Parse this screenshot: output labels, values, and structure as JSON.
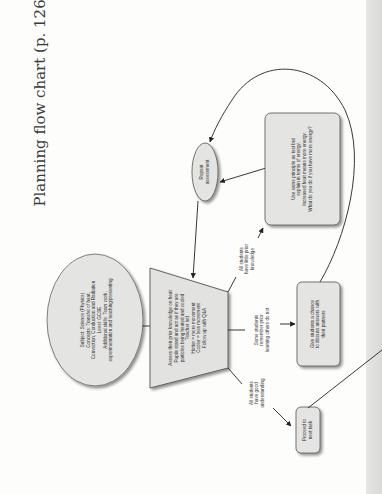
{
  "title": "Planning flow chart (p. 126)",
  "nodes": {
    "subject": {
      "shape": "ellipse",
      "lines": [
        "Subject: Science (Physics)",
        "Concepts: Transfer of heat,",
        "Convection, Conduction and Radiation",
        "Level: GCSE",
        "Additional skills: Team work,",
        "experimentation and teaching/presenting"
      ]
    },
    "assess": {
      "shape": "trapezoid",
      "lines": [
        "Assess their prior knowledge on heat",
        "Pupils stand and act as if they are",
        "particles being heated and cooled",
        "Teacher led",
        "Hotter = more movement",
        "Cooler = less movement",
        "Follow up with Q&A"
      ]
    },
    "repeat": {
      "shape": "ellipse",
      "lines": [
        "Repeat",
        "assessment"
      ]
    },
    "energy": {
      "shape": "rounded-rect",
      "lines": [
        "Use same principle as test but",
        "explain in terms of energy.",
        "Increased heat means more energy.",
        "What do you do if you have more energy?"
      ]
    },
    "discuss": {
      "shape": "rounded-rect",
      "lines": [
        "Give students a chance",
        "to discuss answers with",
        "their partners"
      ]
    },
    "proceed": {
      "shape": "rounded-rect",
      "lines": [
        "Proceed to",
        "next task"
      ]
    }
  },
  "edge_labels": {
    "little": [
      "All students",
      "have little prior",
      "knowledge"
    ],
    "some": [
      "Some students",
      "remember prior",
      "learning others do not"
    ],
    "good": [
      "All students",
      "have good",
      "understanding"
    ]
  },
  "colors": {
    "node_fill": "#e4e4e2",
    "node_stroke": "#555555",
    "line": "#222222"
  }
}
